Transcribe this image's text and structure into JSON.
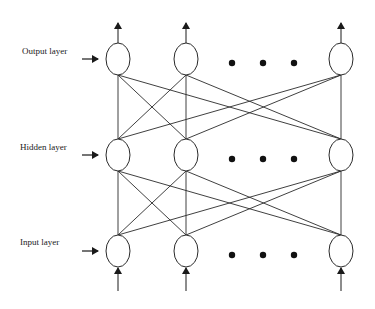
{
  "diagram": {
    "title": "",
    "type": "feedforward-neural-network",
    "colors": {
      "stroke": "#2a2a2a",
      "background": "#ffffff",
      "text": "#1a1a1a"
    },
    "layers": [
      {
        "id": "output",
        "label": "Output layer",
        "y": 59,
        "label_y": 51,
        "has_output_arrows": true,
        "has_input_arrows": false
      },
      {
        "id": "hidden",
        "label": "Hidden layer",
        "y": 155,
        "label_y": 146,
        "has_output_arrows": false,
        "has_input_arrows": false
      },
      {
        "id": "input",
        "label": "Input layer",
        "y": 251,
        "label_y": 241,
        "has_output_arrows": false,
        "has_input_arrows": true
      }
    ],
    "node_columns_x": [
      118,
      186,
      341
    ],
    "node_radius": {
      "rx": 12,
      "ry": 16
    },
    "ellipsis_dots_x": [
      232,
      263,
      294
    ],
    "connections": "fully-connected between adjacent layers",
    "side_arrow": {
      "x1": 82,
      "x2": 98
    }
  }
}
